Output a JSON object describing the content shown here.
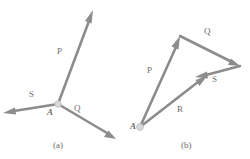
{
  "figure": {
    "background_color": "#ffffff",
    "stroke_color": "#8c8c8c",
    "label_color": "#6b6b6b",
    "node_fill_color": "#d6d6d6",
    "width": 250,
    "height": 159,
    "panels": [
      {
        "id": "a",
        "caption": "(a)",
        "caption_pos": {
          "x": 53,
          "y": 141
        },
        "origin_label": "A",
        "origin_label_pos": {
          "x": 47,
          "y": 108
        },
        "origin_point": {
          "x": 58,
          "y": 104
        },
        "vectors": [
          {
            "name": "P",
            "label": "P",
            "label_pos": {
              "x": 57,
              "y": 47
            },
            "from": {
              "x": 58,
              "y": 104
            },
            "to": {
              "x": 93,
              "y": 10
            }
          },
          {
            "name": "S",
            "label": "S",
            "label_pos": {
              "x": 29,
              "y": 90
            },
            "from": {
              "x": 58,
              "y": 104
            },
            "to": {
              "x": 3,
              "y": 113
            }
          },
          {
            "name": "Q",
            "label": "Q",
            "label_pos": {
              "x": 74,
              "y": 104
            },
            "from": {
              "x": 58,
              "y": 104
            },
            "to": {
              "x": 116,
              "y": 139
            }
          }
        ]
      },
      {
        "id": "b",
        "caption": "(b)",
        "caption_pos": {
          "x": 181,
          "y": 141
        },
        "origin_label": "A",
        "origin_label_pos": {
          "x": 130,
          "y": 122
        },
        "origin_point": {
          "x": 140,
          "y": 127
        },
        "vectors": [
          {
            "name": "P",
            "label": "P",
            "label_pos": {
              "x": 147,
              "y": 66
            },
            "from": {
              "x": 140,
              "y": 127
            },
            "to": {
              "x": 180,
              "y": 36
            }
          },
          {
            "name": "Q",
            "label": "Q",
            "label_pos": {
              "x": 204,
              "y": 27
            },
            "from": {
              "x": 180,
              "y": 36
            },
            "to": {
              "x": 240,
              "y": 66
            }
          },
          {
            "name": "S",
            "label": "S",
            "label_pos": {
              "x": 212,
              "y": 75
            },
            "from": {
              "x": 240,
              "y": 66
            },
            "to": {
              "x": 195,
              "y": 77
            }
          },
          {
            "name": "R",
            "label": "R",
            "label_pos": {
              "x": 177,
              "y": 105
            },
            "from": {
              "x": 140,
              "y": 127
            },
            "to": {
              "x": 207,
              "y": 76
            }
          }
        ]
      }
    ]
  }
}
